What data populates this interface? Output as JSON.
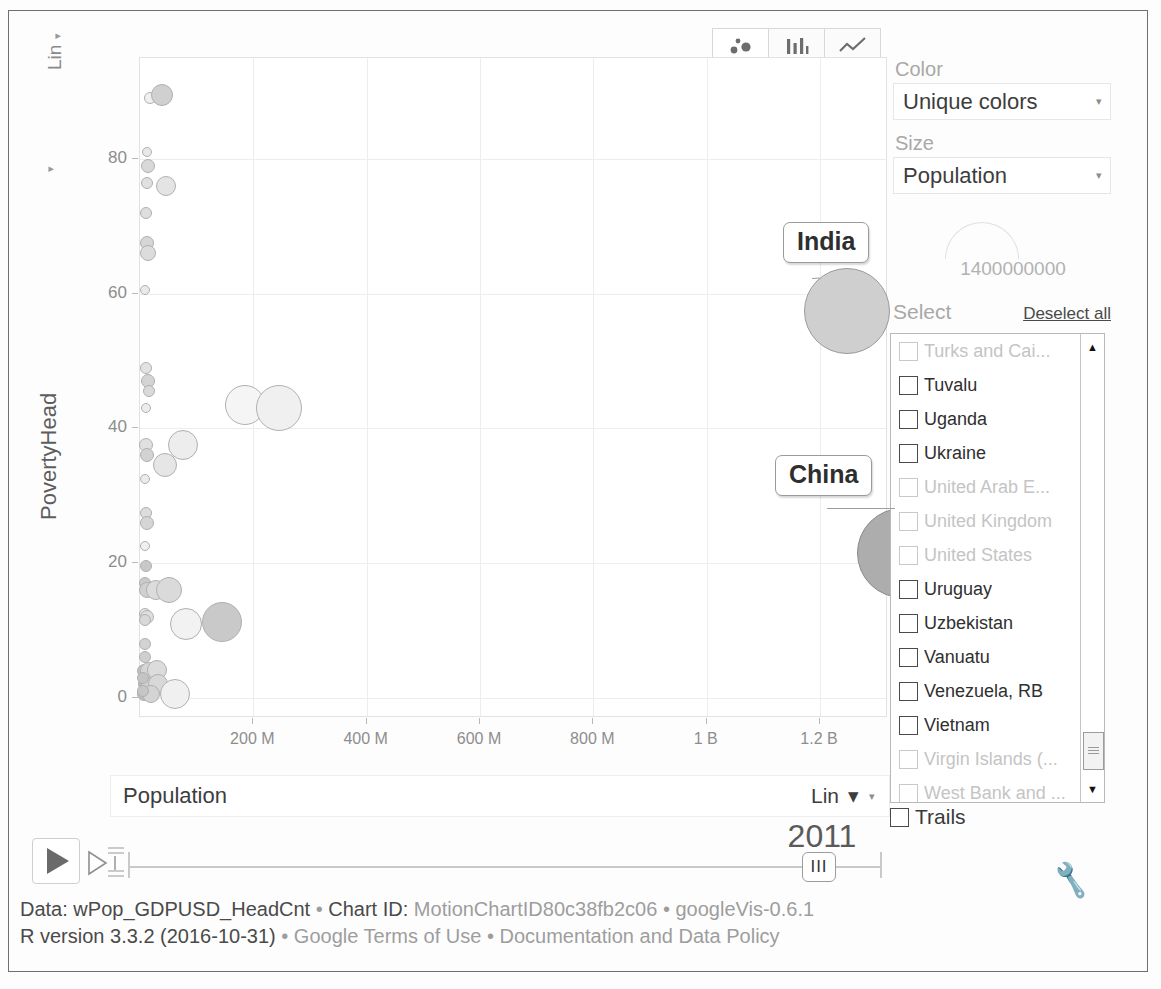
{
  "chart_data": {
    "type": "scatter",
    "title": "",
    "xlabel": "Population",
    "ylabel": "PovertyHead",
    "x_ticks": [
      "200 M",
      "400 M",
      "600 M",
      "800 M",
      "1 B",
      "1.2 B"
    ],
    "x_tick_values": [
      200000000,
      400000000,
      600000000,
      800000000,
      1000000000,
      1200000000
    ],
    "y_ticks": [
      "0",
      "20",
      "40",
      "60",
      "80"
    ],
    "y_tick_values": [
      0,
      20,
      40,
      60,
      80
    ],
    "xlim": [
      0,
      1320000000
    ],
    "ylim": [
      -3,
      95
    ],
    "grid": true,
    "legend": "none",
    "x_scale": "Lin",
    "y_scale": "Lin",
    "size_field": "Population",
    "size_max_value": "1400000000",
    "color_mode": "Unique colors",
    "year": "2011",
    "labeled_points": [
      {
        "label": "India",
        "x": 1247000000,
        "y": 57.5,
        "size": 1247000000
      },
      {
        "label": "China",
        "x": 1344000000,
        "y": 21.5,
        "size": 1344000000
      }
    ],
    "points": [
      {
        "x": 18000000,
        "y": 89.0,
        "r": 6,
        "fill": "#f0f0f0"
      },
      {
        "x": 38000000,
        "y": 89.5,
        "r": 11,
        "fill": "#d0d0d0"
      },
      {
        "x": 13000000,
        "y": 81.0,
        "r": 5,
        "fill": "#e8e8e8"
      },
      {
        "x": 14000000,
        "y": 79.0,
        "r": 7,
        "fill": "#d8d8d8"
      },
      {
        "x": 12000000,
        "y": 76.5,
        "r": 6,
        "fill": "#e0e0e0"
      },
      {
        "x": 46000000,
        "y": 76.0,
        "r": 10,
        "fill": "#e4e4e4"
      },
      {
        "x": 10000000,
        "y": 72.0,
        "r": 6,
        "fill": "#dedede"
      },
      {
        "x": 12000000,
        "y": 67.5,
        "r": 7,
        "fill": "#d6d6d6"
      },
      {
        "x": 14000000,
        "y": 66.0,
        "r": 8,
        "fill": "#dcdcdc"
      },
      {
        "x": 9000000,
        "y": 60.5,
        "r": 5,
        "fill": "#eaeaea"
      },
      {
        "x": 11000000,
        "y": 49.0,
        "r": 6,
        "fill": "#e2e2e2"
      },
      {
        "x": 14000000,
        "y": 47.0,
        "r": 7,
        "fill": "#d4d4d4"
      },
      {
        "x": 16000000,
        "y": 45.5,
        "r": 6,
        "fill": "#dadada"
      },
      {
        "x": 10000000,
        "y": 43.0,
        "r": 5,
        "fill": "#ececec"
      },
      {
        "x": 185000000,
        "y": 43.5,
        "r": 20,
        "fill": "#f5f5f5"
      },
      {
        "x": 245000000,
        "y": 43.0,
        "r": 23,
        "fill": "#f0f0f0"
      },
      {
        "x": 11000000,
        "y": 37.5,
        "r": 7,
        "fill": "#e0e0e0"
      },
      {
        "x": 12000000,
        "y": 36.0,
        "r": 7,
        "fill": "#d2d2d2"
      },
      {
        "x": 75000000,
        "y": 37.5,
        "r": 15,
        "fill": "#ededed"
      },
      {
        "x": 44000000,
        "y": 34.5,
        "r": 12,
        "fill": "#e6e6e6"
      },
      {
        "x": 9000000,
        "y": 32.5,
        "r": 5,
        "fill": "#ebebeb"
      },
      {
        "x": 10000000,
        "y": 27.5,
        "r": 6,
        "fill": "#dddddd"
      },
      {
        "x": 12000000,
        "y": 26.0,
        "r": 7,
        "fill": "#d5d5d5"
      },
      {
        "x": 9000000,
        "y": 22.5,
        "r": 5,
        "fill": "#efefef"
      },
      {
        "x": 10000000,
        "y": 19.5,
        "r": 6,
        "fill": "#c8c8c8"
      },
      {
        "x": 8000000,
        "y": 17.0,
        "r": 6,
        "fill": "#cacaca"
      },
      {
        "x": 13000000,
        "y": 16.0,
        "r": 8,
        "fill": "#d0d0d0"
      },
      {
        "x": 28000000,
        "y": 16.0,
        "r": 10,
        "fill": "#dcdcdc"
      },
      {
        "x": 52000000,
        "y": 16.0,
        "r": 13,
        "fill": "#dadada"
      },
      {
        "x": 8000000,
        "y": 12.5,
        "r": 6,
        "fill": "#e6e6e6"
      },
      {
        "x": 13000000,
        "y": 12.0,
        "r": 7,
        "fill": "#dededd"
      },
      {
        "x": 8000000,
        "y": 11.5,
        "r": 6,
        "fill": "#d8d8d8"
      },
      {
        "x": 82000000,
        "y": 11.0,
        "r": 16,
        "fill": "#f2f2f2"
      },
      {
        "x": 145000000,
        "y": 11.3,
        "r": 20,
        "fill": "#c9c9c9"
      },
      {
        "x": 9000000,
        "y": 8.0,
        "r": 6,
        "fill": "#d3d3d3"
      },
      {
        "x": 8000000,
        "y": 6.0,
        "r": 6,
        "fill": "#cfcfcf"
      },
      {
        "x": 7000000,
        "y": 4.0,
        "r": 7,
        "fill": "#c0c0c0"
      },
      {
        "x": 16000000,
        "y": 4.0,
        "r": 9,
        "fill": "#d6d6d6"
      },
      {
        "x": 30000000,
        "y": 4.2,
        "r": 10,
        "fill": "#dcdcdc"
      },
      {
        "x": 8000000,
        "y": 2.0,
        "r": 7,
        "fill": "#b8b8b8"
      },
      {
        "x": 18000000,
        "y": 1.8,
        "r": 9,
        "fill": "#d2d2d2"
      },
      {
        "x": 32000000,
        "y": 2.0,
        "r": 10,
        "fill": "#d8d8d8"
      },
      {
        "x": 7000000,
        "y": 0.6,
        "r": 7,
        "fill": "#bdbdbd"
      },
      {
        "x": 20000000,
        "y": 0.5,
        "r": 9,
        "fill": "#d4d4d4"
      },
      {
        "x": 62000000,
        "y": 0.6,
        "r": 15,
        "fill": "#f0f0f0"
      },
      {
        "x": 6000000,
        "y": 3.0,
        "r": 6,
        "fill": "#c4c4c4"
      },
      {
        "x": 6000000,
        "y": 1.0,
        "r": 6,
        "fill": "#c6c6c6"
      }
    ]
  },
  "chart_tabs": [
    {
      "name": "bubble-chart-tab",
      "icon": "bubbles-icon",
      "selected": true
    },
    {
      "name": "bar-chart-tab",
      "icon": "bars-icon",
      "selected": false
    },
    {
      "name": "line-chart-tab",
      "icon": "line-icon",
      "selected": false
    }
  ],
  "controls": {
    "color_label": "Color",
    "color_value": "Unique colors",
    "size_label": "Size",
    "size_value": "Population",
    "size_max": "1400000000",
    "select_label": "Select",
    "deselect_all": "Deselect all",
    "trails_label": "Trails",
    "x_axis_value": "Population",
    "x_scale": "Lin",
    "y_scale": "Lin"
  },
  "country_list": [
    {
      "name": "Turks and Cai...",
      "enabled": false
    },
    {
      "name": "Tuvalu",
      "enabled": true
    },
    {
      "name": "Uganda",
      "enabled": true
    },
    {
      "name": "Ukraine",
      "enabled": true
    },
    {
      "name": "United Arab E...",
      "enabled": false
    },
    {
      "name": "United Kingdom",
      "enabled": false
    },
    {
      "name": "United States",
      "enabled": false
    },
    {
      "name": "Uruguay",
      "enabled": true
    },
    {
      "name": "Uzbekistan",
      "enabled": true
    },
    {
      "name": "Vanuatu",
      "enabled": true
    },
    {
      "name": "Venezuela, RB",
      "enabled": true
    },
    {
      "name": "Vietnam",
      "enabled": true
    },
    {
      "name": "Virgin Islands (...",
      "enabled": false
    },
    {
      "name": "West Bank and ...",
      "enabled": false
    }
  ],
  "playback": {
    "year": "2011",
    "play_icon": "play-icon",
    "speed_icon": "speed-icon",
    "handle_grip": "III"
  },
  "footer": {
    "line1_a": "Data: wPop_GDPUSD_HeadCnt",
    "sep": " • ",
    "line1_b": "Chart ID: ",
    "line1_id": "MotionChartID80c38fb2c06",
    "line1_c": "googleVis-0.6.1",
    "line2_a": "R version 3.3.2 (2016-10-31)",
    "line2_b": "Google Terms of Use",
    "line2_c": "Documentation and Data Policy"
  },
  "axis": {
    "y_title": "PovertyHead",
    "y_scale_label": "Lin"
  }
}
